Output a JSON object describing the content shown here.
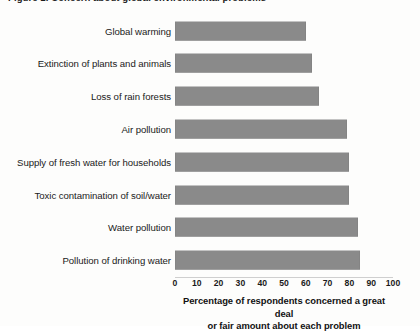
{
  "figure": {
    "clipped_title": "Figure 1.  Concern about global environmental problems",
    "background_color": "#fdfdfc",
    "bar_color": "#8a8a8a",
    "text_color": "#1a1a1a"
  },
  "axis": {
    "title_line_1": "Percentage of respondents concerned a great deal",
    "title_line_2": "or fair amount about each problem",
    "tick_labels": [
      "0",
      "10",
      "20",
      "30",
      "40",
      "50",
      "60",
      "70",
      "80",
      "90",
      "100"
    ]
  },
  "chart_data": {
    "type": "bar",
    "orientation": "horizontal",
    "title": "Figure 1.  Concern about global environmental problems",
    "xlabel": "Percentage of respondents concerned a great deal or fair amount about each problem",
    "ylabel": "",
    "xlim": [
      0,
      100
    ],
    "xticks": [
      0,
      10,
      20,
      30,
      40,
      50,
      60,
      70,
      80,
      90,
      100
    ],
    "grid": false,
    "legend": false,
    "categories": [
      "Global warming",
      "Extinction of plants and animals",
      "Loss of rain forests",
      "Air pollution",
      "Supply of fresh water for households",
      "Toxic contamination of soil/water",
      "Water pollution",
      "Pollution of drinking water"
    ],
    "values": [
      60,
      63,
      66,
      79,
      80,
      80,
      84,
      85
    ],
    "series": [
      {
        "name": "Percentage concerned a great deal or fair amount",
        "color": "#8a8a8a",
        "values": [
          60,
          63,
          66,
          79,
          80,
          80,
          84,
          85
        ]
      }
    ]
  }
}
